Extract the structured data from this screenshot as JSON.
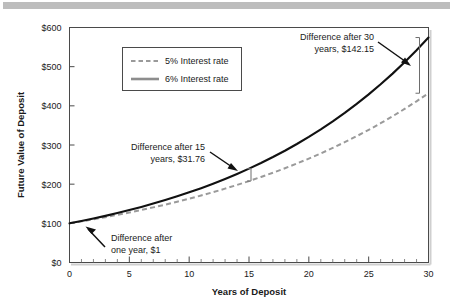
{
  "figure": {
    "top_rule": true,
    "background": "#ffffff"
  },
  "chart_data": {
    "type": "line",
    "title": "",
    "xlabel": "Years of Deposit",
    "ylabel": "Future Value of Deposit",
    "xlim": [
      0,
      30
    ],
    "ylim": [
      0,
      600
    ],
    "xticks": [
      0,
      5,
      10,
      15,
      20,
      25,
      30
    ],
    "xtick_labels": [
      "0",
      "5",
      "10",
      "15",
      "20",
      "25",
      "30"
    ],
    "xminor_step": 1,
    "yticks": [
      0,
      100,
      200,
      300,
      400,
      500,
      600
    ],
    "ytick_labels": [
      "$0",
      "$100",
      "$200",
      "$300",
      "$400",
      "$500",
      "$600"
    ],
    "grid": false,
    "legend_position": "upper left",
    "principal": 100,
    "series": [
      {
        "name": "5% Interest rate",
        "rate": 0.05,
        "style": "dashed",
        "color": "#9a9a9a",
        "x": [
          0,
          1,
          2,
          3,
          4,
          5,
          6,
          7,
          8,
          9,
          10,
          11,
          12,
          13,
          14,
          15,
          16,
          17,
          18,
          19,
          20,
          21,
          22,
          23,
          24,
          25,
          26,
          27,
          28,
          29,
          30
        ],
        "values": [
          100.0,
          105.0,
          110.25,
          115.76,
          121.55,
          127.63,
          134.01,
          140.71,
          147.75,
          155.13,
          162.89,
          171.03,
          179.59,
          188.56,
          197.99,
          207.89,
          218.29,
          229.2,
          240.66,
          252.7,
          265.33,
          278.6,
          292.53,
          307.15,
          322.51,
          338.64,
          355.57,
          373.35,
          392.01,
          411.61,
          432.19
        ]
      },
      {
        "name": "6% Interest rate",
        "rate": 0.06,
        "style": "solid",
        "color": "#111111",
        "x": [
          0,
          1,
          2,
          3,
          4,
          5,
          6,
          7,
          8,
          9,
          10,
          11,
          12,
          13,
          14,
          15,
          16,
          17,
          18,
          19,
          20,
          21,
          22,
          23,
          24,
          25,
          26,
          27,
          28,
          29,
          30
        ],
        "values": [
          100.0,
          106.0,
          112.36,
          119.1,
          126.25,
          133.82,
          141.85,
          150.36,
          159.38,
          168.95,
          179.08,
          189.83,
          201.22,
          213.29,
          226.09,
          239.66,
          254.04,
          269.28,
          285.43,
          302.56,
          320.71,
          339.96,
          360.35,
          381.97,
          404.89,
          429.19,
          454.94,
          482.23,
          511.17,
          541.84,
          574.35
        ]
      }
    ],
    "annotations": [
      {
        "id": "diff-one-year",
        "line1": "Difference after",
        "line2": "one year, $1",
        "text": "Difference after one year, $1",
        "align": "left",
        "x_year": 1,
        "value": 1
      },
      {
        "id": "diff-15-years",
        "line1": "Difference after 15",
        "line2": "years, $31.76",
        "text": "Difference after 15 years, $31.76",
        "align": "right",
        "x_year": 15,
        "value": 31.76
      },
      {
        "id": "diff-30-years",
        "line1": "Difference after 30",
        "line2": "years, $142.15",
        "text": "Difference after 30 years, $142.15",
        "align": "right",
        "x_year": 30,
        "value": 142.15
      }
    ]
  }
}
